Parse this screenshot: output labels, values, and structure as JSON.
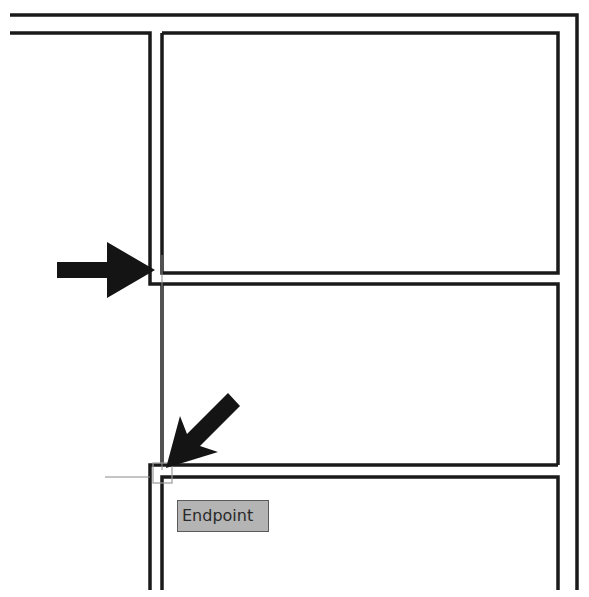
{
  "view": {
    "type": "cad-drawing",
    "background": "#ffffff",
    "line_color": "#1a1a1a"
  },
  "snap": {
    "tooltip_label": "Endpoint",
    "tooltip_bg": "#b4b4b4",
    "marker": "endpoint-square"
  },
  "annotations": {
    "arrows": [
      {
        "name": "callout-arrow-right",
        "direction": "right"
      },
      {
        "name": "callout-arrow-down-left",
        "direction": "down-left"
      }
    ]
  }
}
